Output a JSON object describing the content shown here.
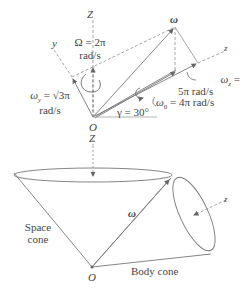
{
  "top_diagram": {
    "axis_Z": "Z",
    "axis_Z_below": "Z",
    "axis_y": "y",
    "axis_z": "z",
    "origin": "O",
    "omega": "ω",
    "Omega_line1": "Ω = 2π",
    "Omega_line2": "rad/s",
    "omega_y_line1": "ω",
    "omega_y_sub": "y",
    "omega_y_eq": " = √3π",
    "omega_y_line2": "rad/s",
    "omega_z_line1": "ω",
    "omega_z_sub": "z",
    "omega_z_eq": " =",
    "omega_z_line2": "5π rad/s",
    "omega_0": "ω",
    "omega_0_sub": "0",
    "omega_0_eq": " = 4π rad/s",
    "gamma": "γ = 30°"
  },
  "bottom_diagram": {
    "axis_Z": "Z",
    "axis_z": "z",
    "origin": "O",
    "omega": "ω",
    "space_cone_line1": "Space",
    "space_cone_line2": "cone",
    "body_cone": "Body cone"
  },
  "colors": {
    "line": "#777777",
    "dash": "#999999",
    "text": "#444444"
  }
}
